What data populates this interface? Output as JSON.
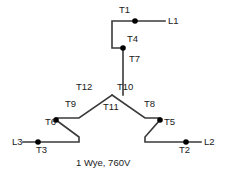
{
  "diagram": {
    "caption": "1 Wye, 760V",
    "title": "1 Wye, 760V",
    "connection_type": "wye",
    "voltage": "760V",
    "colors": {
      "wire": "#3a3a3a",
      "node": "#000000",
      "text": "#1a1a1a",
      "background": "#ffffff"
    },
    "line_terminals": [
      {
        "id": "L1",
        "label": "L1",
        "x": 168,
        "y": 21
      },
      {
        "id": "L2",
        "label": "L2",
        "x": 204,
        "y": 143
      },
      {
        "id": "L3",
        "label": "L3",
        "x": 20,
        "y": 143
      }
    ],
    "lead_labels": [
      {
        "id": "T1",
        "label": "T1",
        "x": 119,
        "y": 7
      },
      {
        "id": "T4",
        "label": "T4",
        "x": 127,
        "y": 38
      },
      {
        "id": "T7",
        "label": "T7",
        "x": 129,
        "y": 58
      },
      {
        "id": "T12",
        "label": "T12",
        "x": 79,
        "y": 86
      },
      {
        "id": "T10",
        "label": "T10",
        "x": 118,
        "y": 86
      },
      {
        "id": "T9",
        "label": "T9",
        "x": 68,
        "y": 103
      },
      {
        "id": "T11",
        "label": "T11",
        "x": 106,
        "y": 106
      },
      {
        "id": "T8",
        "label": "T8",
        "x": 146,
        "y": 103
      },
      {
        "id": "T6",
        "label": "T6",
        "x": 49,
        "y": 122
      },
      {
        "id": "T5",
        "label": "T5",
        "x": 166,
        "y": 122
      },
      {
        "id": "T3",
        "label": "T3",
        "x": 40,
        "y": 146
      },
      {
        "id": "T2",
        "label": "T2",
        "x": 180,
        "y": 146
      }
    ],
    "nodes": [
      {
        "id": "T1-node",
        "x": 135,
        "y": 21
      },
      {
        "id": "T4-node",
        "x": 123,
        "y": 48
      },
      {
        "id": "T6-node",
        "x": 56,
        "y": 120
      },
      {
        "id": "T3-node",
        "x": 38,
        "y": 142
      },
      {
        "id": "T5-node",
        "x": 160,
        "y": 120
      },
      {
        "id": "T2-node",
        "x": 186,
        "y": 142
      }
    ],
    "center_node": {
      "id": "wye-center",
      "x": 112,
      "y": 95
    }
  }
}
